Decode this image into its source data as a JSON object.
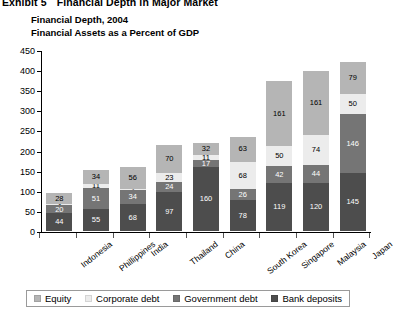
{
  "exhibit": {
    "number": "Exhibit 5",
    "caption": "Financial Depth in Major Market"
  },
  "titles": {
    "line1": "Financial Depth, 2004",
    "line2": "Financial Assets as a Percent of GDP"
  },
  "legend": [
    {
      "label": "Equity",
      "color": "#b5b5b5"
    },
    {
      "label": "Corporate debt",
      "color": "#ececec"
    },
    {
      "label": "Government debt",
      "color": "#757575"
    },
    {
      "label": "Bank deposits",
      "color": "#4d4d4d"
    }
  ],
  "chart_data": {
    "type": "bar",
    "subtype": "stacked-vertical",
    "title": "Financial Depth, 2004",
    "subtitle": "Financial Assets as a Percent of GDP",
    "xlabel": "",
    "ylabel": "",
    "ylim": [
      0,
      450
    ],
    "yticks": [
      0,
      50,
      100,
      150,
      200,
      250,
      300,
      350,
      400,
      450
    ],
    "grid": false,
    "legend_position": "bottom",
    "categories": [
      "Indonesia",
      "Phillippines",
      "India",
      "Thailand",
      "China",
      "South Korea",
      "Singapore",
      "Malaysia",
      "Japan"
    ],
    "series": [
      {
        "name": "Bank deposits",
        "color": "#4d4d4d",
        "values": [
          44,
          55,
          68,
          97,
          160,
          78,
          119,
          120,
          145
        ]
      },
      {
        "name": "Government debt",
        "color": "#757575",
        "values": [
          20,
          51,
          34,
          24,
          17,
          26,
          42,
          44,
          146
        ]
      },
      {
        "name": "Corporate debt",
        "color": "#ececec",
        "values": [
          3,
          11,
          2,
          23,
          11,
          68,
          50,
          74,
          50
        ]
      },
      {
        "name": "Equity",
        "color": "#b5b5b5",
        "values": [
          28,
          34,
          56,
          70,
          32,
          63,
          161,
          161,
          79
        ]
      }
    ],
    "totals": [
      95,
      151,
      160,
      214,
      220,
      235,
      372,
      399,
      420
    ]
  }
}
